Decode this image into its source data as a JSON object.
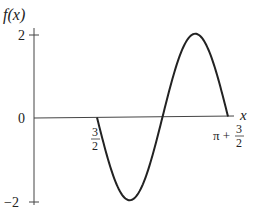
{
  "chart_data": {
    "type": "line",
    "title": "",
    "ylabel": "f(x)",
    "xlabel": "x",
    "ylim": [
      -2,
      2
    ],
    "xlim": [
      1.5,
      4.6416
    ],
    "y_ticks": [
      "2",
      "0",
      "-2"
    ],
    "x_tick_labels": [
      {
        "value": 1.5,
        "label_top": "3",
        "label_bottom": "2",
        "prefix": ""
      },
      {
        "value": 4.6416,
        "label_top": "3",
        "label_bottom": "2",
        "prefix": "π +"
      }
    ],
    "series": [
      {
        "name": "f(x)",
        "description": "one full period of a sinusoid starting at 0, descending to -2, rising to 2, returning to 0",
        "x": [
          1.5,
          2.285,
          3.071,
          3.856,
          4.642
        ],
        "values": [
          0,
          -2,
          0,
          2,
          0
        ]
      }
    ],
    "grid": false,
    "legend": "none"
  },
  "labels": {
    "y_axis": "f(x)",
    "x_axis": "x",
    "y_top": "2",
    "y_zero": "0",
    "y_bottom": "−2",
    "x_start_num": "3",
    "x_start_den": "2",
    "x_end_prefix": "π +",
    "x_end_num": "3",
    "x_end_den": "2"
  }
}
